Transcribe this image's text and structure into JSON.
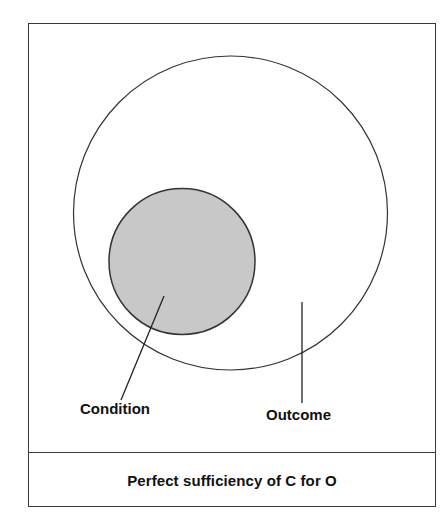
{
  "diagram": {
    "caption": "Perfect sufficiency of C for O",
    "sets": [
      {
        "id": "outcome",
        "label": "Outcome",
        "shape": "circle",
        "cx": 230.5,
        "cy": 213,
        "r": 157,
        "fill": "#ffffff",
        "stroke": "#333333"
      },
      {
        "id": "condition",
        "label": "Condition",
        "shape": "circle",
        "cx": 182,
        "cy": 261.5,
        "r": 73,
        "fill": "#c8c8c8",
        "stroke": "#333333"
      }
    ],
    "pointers": [
      {
        "target": "condition",
        "x1": 164,
        "y1": 296,
        "x2": 121,
        "y2": 400
      },
      {
        "target": "outcome",
        "x1": 302,
        "y1": 302,
        "x2": 302,
        "y2": 403
      }
    ],
    "labels": {
      "condition": "Condition",
      "outcome": "Outcome"
    },
    "colors": {
      "border": "#3a3a3a",
      "condition_fill": "#c8c8c8",
      "outline": "#333333",
      "text": "#111111"
    }
  }
}
